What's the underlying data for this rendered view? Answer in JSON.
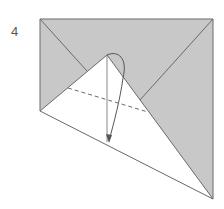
{
  "step": {
    "number": "4"
  },
  "colors": {
    "shaded": "#c8c8c8",
    "paper": "#ffffff",
    "line": "#6a6a6a"
  }
}
